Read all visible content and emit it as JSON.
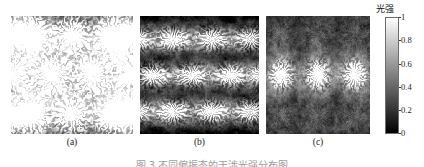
{
  "figure": {
    "colorbar": {
      "title": "光强",
      "title_icon": "intensity-colorbar-label",
      "ticks": [
        "1",
        "0.8",
        "0.6",
        "0.4",
        "0.2",
        "0"
      ],
      "tick_values": [
        1,
        0.8,
        0.6,
        0.4,
        0.2,
        0
      ],
      "colormap": "gray",
      "min_color": "#000000",
      "max_color": "#ffffff"
    },
    "caption": "图 3 不同偏振态的干涉光强分布图",
    "panels": [
      {
        "id": "a",
        "label": "(a)",
        "pattern": "round-spots",
        "rows": 3,
        "cols": 3,
        "offset_rows": true,
        "sigma_x": 0.165,
        "sigma_y": 0.175,
        "peak": 1.0
      },
      {
        "id": "b",
        "label": "(b)",
        "pattern": "horizontal-ellipses",
        "rows": 3,
        "cols": 3,
        "offset_rows": false,
        "sigma_x": 0.145,
        "sigma_y": 0.085,
        "peak": 1.0
      },
      {
        "id": "c",
        "label": "(c)",
        "pattern": "single-bright-row",
        "rows": 3,
        "cols": 3,
        "offset_rows": false,
        "sigma_x": 0.11,
        "sigma_y": 0.11,
        "peak": 1.0
      }
    ]
  },
  "chart_data": {
    "type": "heatmap",
    "title": "",
    "xlabel": "",
    "ylabel": "",
    "colorbar_label": "光强",
    "colorbar_range": [
      0,
      1
    ],
    "colorbar_ticks": [
      0,
      0.2,
      0.4,
      0.6,
      0.8,
      1
    ],
    "colormap": "gray",
    "panel_labels": [
      "(a)",
      "(b)",
      "(c)"
    ],
    "panels": [
      {
        "label": "(a)",
        "description": "Near-circular bright interference maxima arranged on a hexagonal (offset) lattice; 3 rows x 3 columns of full spots plus partial spots at edges.",
        "peak_positions": [
          [
            0.17,
            0.17
          ],
          [
            0.5,
            0.17
          ],
          [
            0.83,
            0.17
          ],
          [
            0.0,
            0.5
          ],
          [
            0.33,
            0.5
          ],
          [
            0.66,
            0.5
          ],
          [
            1.0,
            0.5
          ],
          [
            0.17,
            0.83
          ],
          [
            0.5,
            0.83
          ],
          [
            0.83,
            0.83
          ]
        ],
        "peak_values": [
          1.0,
          1.0,
          1.0,
          0.95,
          1.0,
          1.0,
          0.95,
          1.0,
          1.0,
          1.0
        ],
        "background_value": 0.07
      },
      {
        "label": "(b)",
        "description": "Horizontally elongated elliptical maxima on a rectangular lattice, dark horizontal bands between rows.",
        "peak_positions": [
          [
            0.0,
            0.2
          ],
          [
            0.27,
            0.2
          ],
          [
            0.6,
            0.2
          ],
          [
            0.93,
            0.2
          ],
          [
            0.1,
            0.5
          ],
          [
            0.43,
            0.5
          ],
          [
            0.76,
            0.5
          ],
          [
            1.0,
            0.5
          ],
          [
            0.0,
            0.8
          ],
          [
            0.27,
            0.8
          ],
          [
            0.6,
            0.8
          ],
          [
            0.93,
            0.8
          ]
        ],
        "peak_values": [
          0.8,
          1.0,
          1.0,
          0.9,
          1.0,
          1.0,
          1.0,
          0.8,
          0.8,
          1.0,
          1.0,
          0.9
        ],
        "background_value": 0.05
      },
      {
        "label": "(c)",
        "description": "One strongly bright central row of compact maxima; upper and lower rows suppressed to mid-gray mottled blobs.",
        "peak_positions": [
          [
            0.15,
            0.17
          ],
          [
            0.5,
            0.17
          ],
          [
            0.85,
            0.17
          ],
          [
            0.15,
            0.5
          ],
          [
            0.5,
            0.5
          ],
          [
            0.85,
            0.5
          ],
          [
            0.15,
            0.83
          ],
          [
            0.5,
            0.83
          ],
          [
            0.85,
            0.83
          ]
        ],
        "peak_values": [
          0.3,
          0.3,
          0.3,
          1.0,
          1.0,
          1.0,
          0.3,
          0.3,
          0.3
        ],
        "background_value": 0.3
      }
    ]
  }
}
